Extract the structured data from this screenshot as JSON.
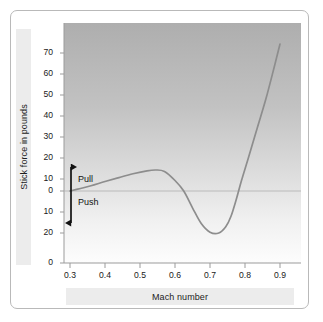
{
  "chart_data": {
    "type": "line",
    "title": "",
    "xlabel": "Mach number",
    "ylabel": "Stick force in pounds",
    "xlim": [
      0.3,
      0.95
    ],
    "ylim": [
      -25,
      75
    ],
    "grid": false,
    "legend": "none",
    "x_ticks": [
      "0.3",
      "0.4",
      "0.5",
      "0.6",
      "0.7",
      "0.8",
      "0.9"
    ],
    "x_tick_values": [
      0.3,
      0.4,
      0.5,
      0.6,
      0.7,
      0.8,
      0.9
    ],
    "y_ticks": [
      "70",
      "60",
      "50",
      "40",
      "30",
      "20",
      "10",
      "0",
      "10",
      "20",
      "0"
    ],
    "y_tick_values": [
      70,
      60,
      50,
      40,
      30,
      20,
      10,
      0,
      -10,
      -20,
      -25
    ],
    "annotations": [
      {
        "name": "pull-label",
        "text": "Pull"
      },
      {
        "name": "push-label",
        "text": "Push"
      },
      {
        "name": "pull-push-arrow",
        "text": ""
      }
    ],
    "series": [
      {
        "name": "Stick force",
        "color": "#8d8d8d",
        "x": [
          0.3,
          0.33,
          0.36,
          0.4,
          0.44,
          0.48,
          0.52,
          0.545,
          0.57,
          0.6,
          0.625,
          0.65,
          0.675,
          0.7,
          0.725,
          0.745,
          0.76,
          0.775,
          0.79,
          0.81,
          0.835,
          0.86,
          0.885,
          0.9
        ],
        "y": [
          0.0,
          1.2,
          2.5,
          4.5,
          6.4,
          8.2,
          9.6,
          10.0,
          9.3,
          5.0,
          0.0,
          -8.0,
          -15.5,
          -19.6,
          -20.0,
          -17.0,
          -12.0,
          -4.0,
          5.0,
          16.0,
          30.0,
          44.0,
          60.0,
          70.0
        ]
      }
    ]
  },
  "axis_titles": {
    "y": "Stick force in pounds",
    "x": "Mach number"
  },
  "colors": {
    "curve": "#8d8d8d",
    "plot_top": "#b0b0b0",
    "plot_bottom": "#fcfcfc",
    "axis": "#9a9a9a",
    "band": "#ececec",
    "card_border": "#b9b9b9",
    "arrow": "#121212"
  }
}
